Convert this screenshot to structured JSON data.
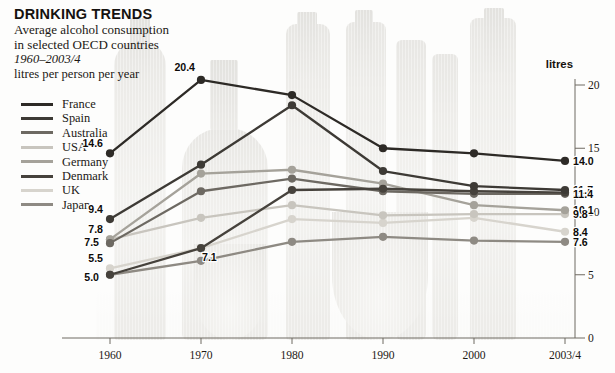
{
  "header": {
    "title": "DRINKING TRENDS",
    "subtitle_line1": "Average alcohol consumption",
    "subtitle_line2": "in selected OECD countries",
    "period": "1960–2003/4",
    "units_line": "litres per person per year"
  },
  "axis": {
    "unit_label": "litres",
    "y_ticks": [
      "20",
      "15",
      "10",
      "5",
      "0"
    ],
    "x_ticks": [
      "1960",
      "1970",
      "1980",
      "1990",
      "2000",
      "2003/4"
    ]
  },
  "legend": {
    "items": [
      {
        "label": "France",
        "color": "#2d2a26"
      },
      {
        "label": "Spain",
        "color": "#3d3a35"
      },
      {
        "label": "Australia",
        "color": "#6d6962"
      },
      {
        "label": "USA",
        "color": "#c8c5be"
      },
      {
        "label": "Germany",
        "color": "#a5a29a"
      },
      {
        "label": "Denmark",
        "color": "#46423c"
      },
      {
        "label": "UK",
        "color": "#d7d4cd"
      },
      {
        "label": "Japan",
        "color": "#8e8a83"
      }
    ]
  },
  "chart_data": {
    "type": "line",
    "title": "DRINKING TRENDS",
    "subtitle": "Average alcohol consumption in selected OECD countries 1960–2003/4",
    "xlabel": "",
    "ylabel": "litres per person per year",
    "ylim": [
      0,
      20
    ],
    "grid": false,
    "legend_position": "top-left",
    "y_axis_side": "right",
    "categories": [
      "1960",
      "1970",
      "1980",
      "1990",
      "2000",
      "2003/4"
    ],
    "series": [
      {
        "name": "France",
        "color": "#2d2a26",
        "values": [
          14.6,
          20.4,
          19.2,
          15.0,
          14.6,
          14.0
        ],
        "start_label": "14.6",
        "peak_label": "20.4",
        "end_label": "14.0"
      },
      {
        "name": "Spain",
        "color": "#3d3a35",
        "values": [
          9.4,
          13.7,
          18.4,
          13.2,
          12.0,
          11.7
        ],
        "start_label": "9.4",
        "end_label": "11.7"
      },
      {
        "name": "Denmark",
        "color": "#46423c",
        "values": [
          5.0,
          7.1,
          11.7,
          11.8,
          11.6,
          11.5
        ],
        "start_label": "5.0",
        "mid_label": "7.1",
        "end_label": "11.5"
      },
      {
        "name": "Australia",
        "color": "#6d6962",
        "values": [
          7.5,
          11.6,
          12.6,
          11.6,
          11.4,
          11.4
        ],
        "start_label": "7.5",
        "end_label": "11.4"
      },
      {
        "name": "Germany",
        "color": "#a5a29a",
        "values": [
          7.8,
          13.0,
          13.3,
          12.2,
          10.5,
          10.1
        ],
        "start_label": "7.8",
        "end_label": "10.1"
      },
      {
        "name": "USA",
        "color": "#c8c5be",
        "values": [
          7.8,
          9.5,
          10.5,
          9.7,
          9.8,
          9.8
        ],
        "end_label": "9.8"
      },
      {
        "name": "UK",
        "color": "#d7d4cd",
        "values": [
          5.5,
          7.1,
          9.4,
          9.1,
          9.5,
          8.4
        ],
        "start_label": "5.5",
        "end_label": "8.4"
      },
      {
        "name": "Japan",
        "color": "#8e8a83",
        "values": [
          5.0,
          6.1,
          7.6,
          8.0,
          7.7,
          7.6
        ],
        "end_label": "7.6"
      }
    ],
    "annotations": [
      {
        "text": "20.4",
        "series": "France",
        "category": "1970"
      },
      {
        "text": "14.6",
        "series": "France",
        "category": "1960"
      },
      {
        "text": "9.4",
        "series": "Spain",
        "category": "1960"
      },
      {
        "text": "7.8",
        "series": "Germany",
        "category": "1960"
      },
      {
        "text": "7.5",
        "series": "Australia",
        "category": "1960"
      },
      {
        "text": "5.5",
        "series": "UK",
        "category": "1960"
      },
      {
        "text": "5.0",
        "series": "Denmark",
        "category": "1960"
      },
      {
        "text": "7.1",
        "series": "Denmark",
        "category": "1970"
      },
      {
        "text": "14.0",
        "series": "France",
        "category": "2003/4"
      },
      {
        "text": "11.7",
        "series": "Spain",
        "category": "2003/4"
      },
      {
        "text": "11.5",
        "series": "Denmark",
        "category": "2003/4"
      },
      {
        "text": "11.4",
        "series": "Australia",
        "category": "2003/4"
      },
      {
        "text": "10.1",
        "series": "Germany",
        "category": "2003/4"
      },
      {
        "text": "9.8",
        "series": "USA",
        "category": "2003/4"
      },
      {
        "text": "8.4",
        "series": "UK",
        "category": "2003/4"
      },
      {
        "text": "7.6",
        "series": "Japan",
        "category": "2003/4"
      }
    ]
  }
}
